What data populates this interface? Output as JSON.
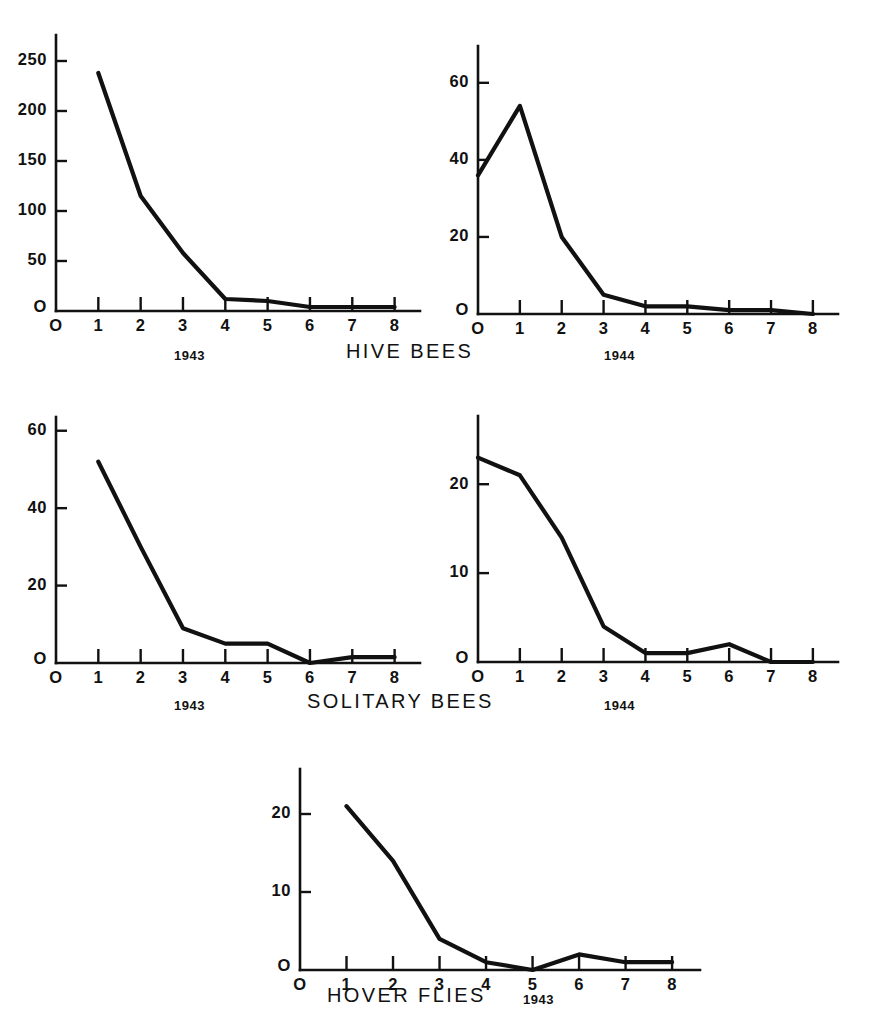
{
  "figure": {
    "background_color": "#ffffff",
    "ink_color": "#111111",
    "panel_count": 5
  },
  "captions": {
    "row1": {
      "left_year": "1943",
      "title": "HIVE  BEES",
      "right_year": "1944"
    },
    "row2": {
      "left_year": "1943",
      "title": "SOLITARY  BEES",
      "right_year": "1944"
    },
    "row3": {
      "title": "HOVER  FLIES",
      "year": "1943"
    }
  },
  "chart_data": [
    {
      "id": "hive-bees-1943",
      "type": "line",
      "title": "HIVE BEES 1943",
      "xlabel": "1943",
      "ylabel": "",
      "x": [
        1,
        2,
        3,
        4,
        5,
        6,
        7,
        8
      ],
      "values": [
        238,
        115,
        58,
        12,
        10,
        4,
        4,
        4
      ],
      "xlim": [
        0,
        8.6
      ],
      "ylim": [
        0,
        270
      ],
      "xticks": [
        0,
        1,
        2,
        3,
        4,
        5,
        6,
        7,
        8
      ],
      "xticklabels": [
        "O",
        "1",
        "2",
        "3",
        "4",
        "5",
        "6",
        "7",
        "8"
      ],
      "yticks": [
        0,
        50,
        100,
        150,
        200,
        250
      ],
      "yticklabels": [
        "O",
        "50",
        "100",
        "150",
        "200",
        "250"
      ],
      "grid": false,
      "legend": "none"
    },
    {
      "id": "hive-bees-1944",
      "type": "line",
      "title": "HIVE BEES 1944",
      "xlabel": "1944",
      "ylabel": "",
      "x": [
        0,
        1,
        2,
        3,
        4,
        5,
        6,
        7,
        8
      ],
      "values": [
        36,
        54,
        20,
        5,
        2,
        2,
        1,
        1,
        0
      ],
      "xlim": [
        0,
        8.6
      ],
      "ylim": [
        0,
        68
      ],
      "xticks": [
        0,
        1,
        2,
        3,
        4,
        5,
        6,
        7,
        8
      ],
      "xticklabels": [
        "O",
        "1",
        "2",
        "3",
        "4",
        "5",
        "6",
        "7",
        "8"
      ],
      "yticks": [
        0,
        20,
        40,
        60
      ],
      "yticklabels": [
        "O",
        "20",
        "40",
        "60"
      ],
      "grid": false,
      "legend": "none"
    },
    {
      "id": "solitary-bees-1943",
      "type": "line",
      "title": "SOLITARY BEES 1943",
      "xlabel": "1943",
      "ylabel": "",
      "x": [
        1,
        2,
        3,
        4,
        5,
        6,
        7,
        8
      ],
      "values": [
        52,
        30,
        9,
        5,
        5,
        0,
        1.5,
        1.5
      ],
      "xlim": [
        0,
        8.6
      ],
      "ylim": [
        0,
        62
      ],
      "xticks": [
        0,
        1,
        2,
        3,
        4,
        5,
        6,
        7,
        8
      ],
      "xticklabels": [
        "O",
        "1",
        "2",
        "3",
        "4",
        "5",
        "6",
        "7",
        "8"
      ],
      "yticks": [
        0,
        20,
        40,
        60
      ],
      "yticklabels": [
        "O",
        "20",
        "40",
        "60"
      ],
      "grid": false,
      "legend": "none"
    },
    {
      "id": "solitary-bees-1944",
      "type": "line",
      "title": "SOLITARY BEES 1944",
      "xlabel": "1944",
      "ylabel": "",
      "x": [
        0,
        1,
        2,
        3,
        4,
        5,
        6,
        7,
        8
      ],
      "values": [
        23,
        21,
        14,
        4,
        1,
        1,
        2,
        0,
        0
      ],
      "xlim": [
        0,
        8.6
      ],
      "ylim": [
        0,
        27
      ],
      "xticks": [
        0,
        1,
        2,
        3,
        4,
        5,
        6,
        7,
        8
      ],
      "xticklabels": [
        "O",
        "1",
        "2",
        "3",
        "4",
        "5",
        "6",
        "7",
        "8"
      ],
      "yticks": [
        0,
        10,
        20
      ],
      "yticklabels": [
        "O",
        "10",
        "20"
      ],
      "grid": false,
      "legend": "none"
    },
    {
      "id": "hover-flies-1943",
      "type": "line",
      "title": "HOVER FLIES 1943",
      "xlabel": "1943",
      "ylabel": "",
      "x": [
        1,
        2,
        3,
        4,
        5,
        6,
        7,
        8
      ],
      "values": [
        21,
        14,
        4,
        1,
        0,
        2,
        1,
        1
      ],
      "xlim": [
        0,
        8.6
      ],
      "ylim": [
        0,
        25
      ],
      "xticks": [
        0,
        1,
        2,
        3,
        4,
        5,
        6,
        7,
        8
      ],
      "xticklabels": [
        "O",
        "1",
        "2",
        "3",
        "4",
        "5",
        "6",
        "7",
        "8"
      ],
      "yticks": [
        0,
        10,
        20
      ],
      "yticklabels": [
        "O",
        "10",
        "20"
      ],
      "grid": false,
      "legend": "none"
    }
  ]
}
